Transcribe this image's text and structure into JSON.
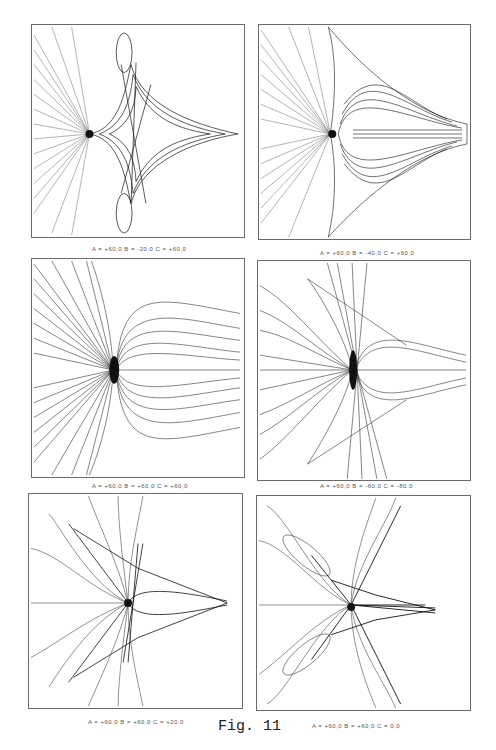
{
  "figure": {
    "label": "Fig. 11",
    "panels": [
      {
        "id": "p1",
        "caption": "A = +60,0  B = -20,0  C = +60,0"
      },
      {
        "id": "p2",
        "caption": "A = +60,0  B = -40,0  C = +60,0"
      },
      {
        "id": "p3",
        "caption": "A = +60,0  B = +60,0  C = +60,0"
      },
      {
        "id": "p4",
        "caption": "A = +60,0  B = -60,0  C = -80,0"
      },
      {
        "id": "p5",
        "caption": "A = +60,0  B = +60,0  C = +20,0"
      },
      {
        "id": "p6",
        "caption": "A = +60,0  B = +60,0  C = 0,0"
      }
    ]
  },
  "colors": {
    "ink": "#1a1a1a",
    "frame": "#6a6a6a",
    "background": "#ffffff"
  }
}
